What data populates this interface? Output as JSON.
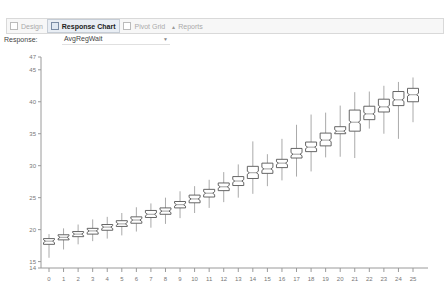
{
  "tabs": [
    {
      "label": "Design",
      "icon": "design-icon",
      "active": false
    },
    {
      "label": "Response Chart",
      "icon": "chart-icon",
      "active": true
    },
    {
      "label": "Pivot Grid",
      "icon": "grid-icon",
      "active": false
    },
    {
      "label": "Reports",
      "icon": "reports-icon",
      "active": false
    }
  ],
  "response": {
    "label": "Response:",
    "value": "AvgRegWait"
  },
  "chart_data": {
    "type": "boxplot",
    "title": "",
    "xlabel": "",
    "ylabel": "",
    "x_ticks": [
      "0",
      "1",
      "2",
      "3",
      "4",
      "5",
      "6",
      "7",
      "8",
      "9",
      "10",
      "11",
      "12",
      "13",
      "14",
      "15",
      "16",
      "17",
      "18",
      "19",
      "20",
      "21",
      "22",
      "23",
      "24",
      "25"
    ],
    "y_ticks": [
      14,
      15,
      20,
      25,
      30,
      35,
      40,
      45,
      47
    ],
    "ylim": [
      14,
      47
    ],
    "xlim": [
      0,
      25
    ],
    "grid": false,
    "legend": "none",
    "boxes": [
      {
        "x": 0,
        "whisker_low": 15.6,
        "q1": 17.7,
        "median": 18.2,
        "q3": 18.6,
        "whisker_high": 19.3
      },
      {
        "x": 1,
        "whisker_low": 16.9,
        "q1": 18.4,
        "median": 18.8,
        "q3": 19.2,
        "whisker_high": 20.2
      },
      {
        "x": 2,
        "whisker_low": 17.7,
        "q1": 18.9,
        "median": 19.3,
        "q3": 19.7,
        "whisker_high": 20.8
      },
      {
        "x": 3,
        "whisker_low": 18.2,
        "q1": 19.3,
        "median": 19.8,
        "q3": 20.2,
        "whisker_high": 21.6
      },
      {
        "x": 4,
        "whisker_low": 18.6,
        "q1": 19.9,
        "median": 20.4,
        "q3": 20.8,
        "whisker_high": 22.0
      },
      {
        "x": 5,
        "whisker_low": 19.1,
        "q1": 20.5,
        "median": 20.9,
        "q3": 21.4,
        "whisker_high": 22.6
      },
      {
        "x": 6,
        "whisker_low": 19.7,
        "q1": 21.0,
        "median": 21.5,
        "q3": 22.0,
        "whisker_high": 23.5
      },
      {
        "x": 7,
        "whisker_low": 20.3,
        "q1": 21.9,
        "median": 22.4,
        "q3": 23.0,
        "whisker_high": 24.1
      },
      {
        "x": 8,
        "whisker_low": 20.9,
        "q1": 22.4,
        "median": 22.9,
        "q3": 23.4,
        "whisker_high": 25.0
      },
      {
        "x": 9,
        "whisker_low": 21.8,
        "q1": 23.4,
        "median": 23.9,
        "q3": 24.4,
        "whisker_high": 26.0
      },
      {
        "x": 10,
        "whisker_low": 22.6,
        "q1": 24.2,
        "median": 24.8,
        "q3": 25.4,
        "whisker_high": 26.8
      },
      {
        "x": 11,
        "whisker_low": 23.4,
        "q1": 25.1,
        "median": 25.7,
        "q3": 26.3,
        "whisker_high": 27.8
      },
      {
        "x": 12,
        "whisker_low": 24.3,
        "q1": 26.1,
        "median": 26.7,
        "q3": 27.3,
        "whisker_high": 29.0
      },
      {
        "x": 13,
        "whisker_low": 25.0,
        "q1": 26.9,
        "median": 27.6,
        "q3": 28.3,
        "whisker_high": 30.2
      },
      {
        "x": 14,
        "whisker_low": 25.6,
        "q1": 28.0,
        "median": 28.9,
        "q3": 29.9,
        "whisker_high": 33.8
      },
      {
        "x": 15,
        "whisker_low": 26.8,
        "q1": 28.8,
        "median": 29.5,
        "q3": 30.4,
        "whisker_high": 31.8
      },
      {
        "x": 16,
        "whisker_low": 27.7,
        "q1": 29.7,
        "median": 30.4,
        "q3": 31.0,
        "whisker_high": 34.2
      },
      {
        "x": 17,
        "whisker_low": 28.3,
        "q1": 31.2,
        "median": 31.8,
        "q3": 32.7,
        "whisker_high": 36.4
      },
      {
        "x": 18,
        "whisker_low": 29.1,
        "q1": 32.2,
        "median": 32.9,
        "q3": 33.7,
        "whisker_high": 38.0
      },
      {
        "x": 19,
        "whisker_low": 31.3,
        "q1": 33.1,
        "median": 34.0,
        "q3": 35.1,
        "whisker_high": 38.3
      },
      {
        "x": 20,
        "whisker_low": 31.4,
        "q1": 35.0,
        "median": 35.4,
        "q3": 36.1,
        "whisker_high": 39.4
      },
      {
        "x": 21,
        "whisker_low": 31.2,
        "q1": 35.4,
        "median": 36.8,
        "q3": 38.7,
        "whisker_high": 41.5
      },
      {
        "x": 22,
        "whisker_low": 35.8,
        "q1": 37.2,
        "median": 38.1,
        "q3": 39.3,
        "whisker_high": 41.6
      },
      {
        "x": 23,
        "whisker_low": 35.0,
        "q1": 38.4,
        "median": 39.2,
        "q3": 40.4,
        "whisker_high": 42.5
      },
      {
        "x": 24,
        "whisker_low": 34.2,
        "q1": 39.4,
        "median": 40.3,
        "q3": 41.6,
        "whisker_high": 43.1
      },
      {
        "x": 25,
        "whisker_low": 36.8,
        "q1": 40.0,
        "median": 41.1,
        "q3": 42.1,
        "whisker_high": 43.8
      }
    ]
  }
}
